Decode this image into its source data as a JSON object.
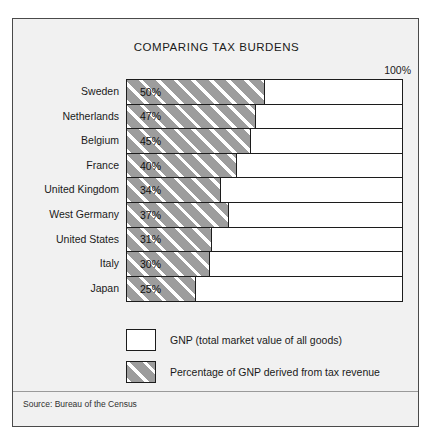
{
  "figure": {
    "title": "COMPARING TAX BURDENS",
    "axis_max_label": "100%",
    "source": "Source: Bureau of the Census"
  },
  "legend": {
    "items": [
      {
        "swatch": "white-square-icon",
        "label": "GNP (total market value of all goods)"
      },
      {
        "swatch": "hatched-square-icon",
        "label": "Percentage of GNP derived from tax revenue"
      }
    ]
  },
  "colors": {
    "frame_background": "#f1f1f1",
    "bar_fill_gray": "#9d9d9d",
    "bar_remainder": "#ffffff",
    "outline": "#1c1c1c"
  },
  "chart_data": {
    "type": "bar",
    "orientation": "horizontal",
    "title": "COMPARING TAX BURDENS",
    "xlabel": "",
    "ylabel": "",
    "xlim": [
      0,
      100
    ],
    "grid": false,
    "legend_position": "bottom",
    "tick_labels": [
      "100%"
    ],
    "categories": [
      "Sweden",
      "Netherlands",
      "Belgium",
      "France",
      "United Kingdom",
      "West Germany",
      "United States",
      "Italy",
      "Japan"
    ],
    "values": [
      50,
      47,
      45,
      40,
      34,
      37,
      31,
      30,
      25
    ],
    "value_labels": [
      "50%",
      "47%",
      "45%",
      "40%",
      "34%",
      "37%",
      "31%",
      "30%",
      "25%"
    ],
    "series": [
      {
        "name": "Percentage of GNP derived from tax revenue",
        "values": [
          50,
          47,
          45,
          40,
          34,
          37,
          31,
          30,
          25
        ]
      },
      {
        "name": "GNP (total market value of all goods)",
        "values": [
          50,
          53,
          55,
          60,
          66,
          63,
          69,
          70,
          75
        ]
      }
    ]
  }
}
